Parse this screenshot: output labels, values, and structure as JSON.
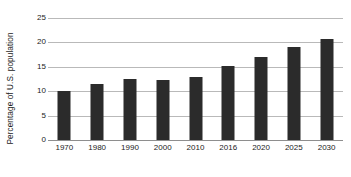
{
  "chart_data": {
    "type": "bar",
    "title": "",
    "subtitle": "",
    "xlabel": "",
    "ylabel": "Percentage of U.S. population",
    "categories": [
      "1970",
      "1980",
      "1990",
      "2000",
      "2010",
      "2016",
      "2020",
      "2025",
      "2030"
    ],
    "values": [
      10.0,
      11.4,
      12.5,
      12.4,
      13.0,
      15.2,
      17.0,
      19.1,
      20.6
    ],
    "ylim": [
      0,
      25
    ],
    "yticks": [
      0,
      5,
      10,
      15,
      20,
      25
    ],
    "ytick_labels": [
      "0",
      "5",
      "10",
      "15",
      "20",
      "25"
    ],
    "grid": true,
    "grid_axis": "y",
    "legend": false,
    "legend_position": "none",
    "annotations": [],
    "colors": {
      "bar": "#2b2b2b",
      "gridline": "#b9b9b9",
      "axis": "#8e8e8e",
      "background": "#ffffff",
      "text": "#232323"
    }
  }
}
